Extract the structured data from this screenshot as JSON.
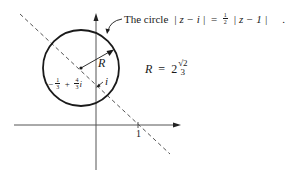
{
  "diagram": {
    "caption_prefix": "The circle",
    "caption_lhs": "| z − i |",
    "caption_eq": "=",
    "caption_half_num": "1",
    "caption_half_den": "2",
    "caption_rhs": "| z − 1 |",
    "caption_dot": ".",
    "radius_label": "R",
    "radius_eq_lhs": "R",
    "radius_eq_sign": "=",
    "radius_eq_coef": "2",
    "radius_eq_sqrt": "√2",
    "radius_eq_den": "3",
    "center_label_minus": "−",
    "center_label_num1": "1",
    "center_label_den1": "3",
    "center_label_plus": "+",
    "center_label_num2": "4",
    "center_label_den2": "3",
    "center_label_i": "i",
    "point_i_label": "i",
    "tick_label": "1",
    "colors": {
      "stroke": "#1a1a1a",
      "dashed": "#555555",
      "axis": "#555555"
    }
  }
}
